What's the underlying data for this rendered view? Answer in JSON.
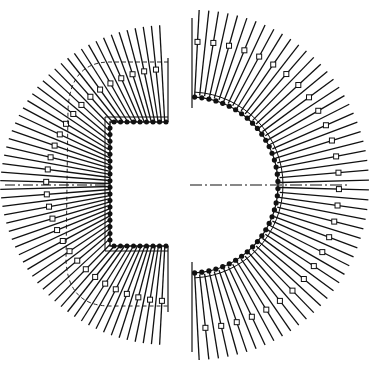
{
  "diagram": {
    "type": "winding-layout",
    "width": 375,
    "height": 370,
    "center": [
      185,
      185
    ],
    "stroke_color": "#111111",
    "background": "#ffffff",
    "left_section": {
      "shape": "c-bracket",
      "inner_rect": {
        "x": 110,
        "y": 122,
        "w": 58,
        "h": 124
      },
      "outer_radius": 168,
      "inner_box_radius": 122,
      "box_frame": {
        "x": 76,
        "y": 58,
        "w": 92,
        "h": 252
      },
      "top_dot_count": 9,
      "side_dot_count": 18,
      "bottom_dot_count": 9,
      "radial_line_count": 60,
      "angle_start_deg": 93,
      "angle_end_deg": 267
    },
    "right_section": {
      "shape": "semicircle",
      "inner_radius": 88,
      "square_radius": 143,
      "outer_radius": 175,
      "center_x": 190,
      "dot_count": 38,
      "radial_line_count": 56,
      "angle_start_deg": -87,
      "angle_end_deg": 87
    },
    "centerline": {
      "y": 185,
      "x_start": 5,
      "x_end": 350,
      "style": "dash-dot"
    }
  }
}
